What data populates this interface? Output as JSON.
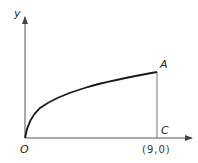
{
  "diagram": {
    "axes": {
      "x_label": "",
      "y_label": "y"
    },
    "points": {
      "origin": "O",
      "A": "A",
      "C": "C",
      "C_coord": "(9,0)"
    },
    "curve": "y = sqrt(x) from O to A",
    "stroke_color": "#1a1a1a",
    "line_color": "#555555"
  }
}
